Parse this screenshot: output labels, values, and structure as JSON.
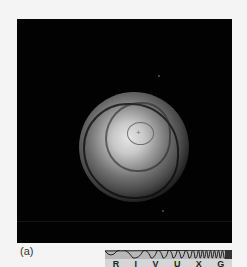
{
  "figure": {
    "panel_label": "(a)",
    "colors": {
      "background": "#020202",
      "page": "#f4f4f4"
    }
  },
  "spectrum_bar": {
    "bands": [
      "R",
      "I",
      "V",
      "U",
      "X",
      "G"
    ],
    "highlighted": "none"
  }
}
